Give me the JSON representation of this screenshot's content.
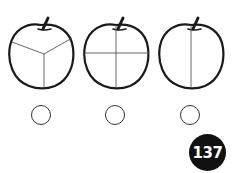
{
  "apples": [
    {
      "id": "apple-thirds",
      "divisions": 3,
      "label": "apple divided into 3 parts"
    },
    {
      "id": "apple-quarters",
      "divisions": 4,
      "label": "apple divided into 4 parts"
    },
    {
      "id": "apple-halves",
      "divisions": 2,
      "label": "apple divided into 2 parts"
    }
  ],
  "answer_circles": [
    {
      "value": ""
    },
    {
      "value": ""
    },
    {
      "value": ""
    }
  ],
  "page_badge": {
    "number": "137",
    "background": "#111111",
    "color": "#ffffff"
  },
  "colors": {
    "outline": "#1a1a1a",
    "division_line": "#555555"
  }
}
